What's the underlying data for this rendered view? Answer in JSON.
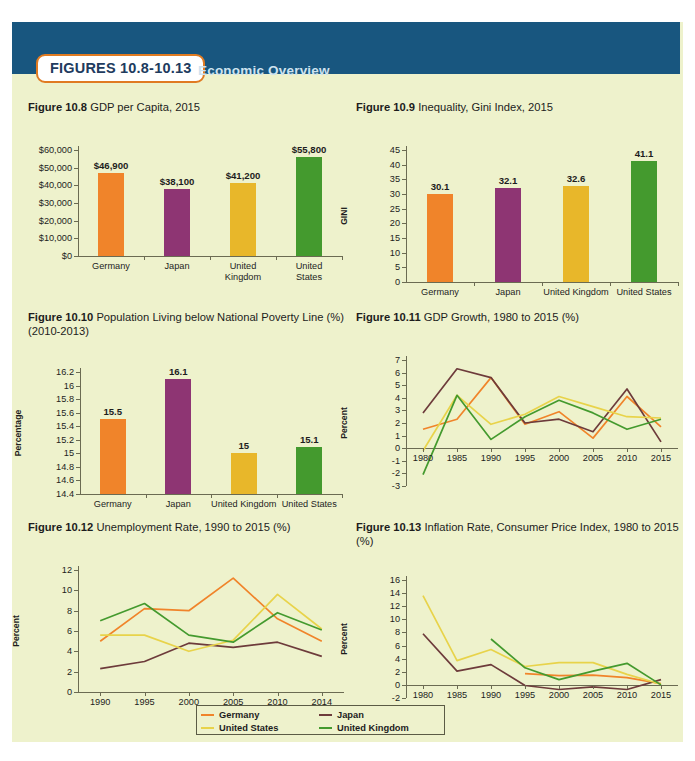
{
  "header": {
    "badge_label": "FIGURES 10.8-10.13",
    "title": "Economic Overview",
    "bar_color": "#18567f",
    "badge_border_color": "#e07b22"
  },
  "palette": {
    "germany": "#f0842a",
    "japan": "#8e3573",
    "united_states": "#e8b72a",
    "united_kingdom": "#449a2e",
    "japan_line": "#6d3b3b",
    "background": "#eef2cc",
    "axis": "#6b6b52"
  },
  "legend": {
    "items": [
      {
        "label": "Germany",
        "color": "#f0842a"
      },
      {
        "label": "Japan",
        "color": "#6d3b3b"
      },
      {
        "label": "United States",
        "color": "#e8d34a"
      },
      {
        "label": "United Kingdom",
        "color": "#449a2e"
      }
    ]
  },
  "chart_data": [
    {
      "id": "fig108",
      "type": "bar",
      "title_bold": "Figure 10.8",
      "title_rest": " GDP per Capita, 2015",
      "categories": [
        "Germany",
        "Japan",
        "United\nKingdom",
        "United\nStates"
      ],
      "values": [
        46900,
        38100,
        41200,
        55800
      ],
      "value_labels": [
        "$46,900",
        "$38,100",
        "$41,200",
        "$55,800"
      ],
      "colors": [
        "#f0842a",
        "#8e3573",
        "#e8b72a",
        "#449a2e"
      ],
      "ylabel": "",
      "xlabel": "",
      "ylim": [
        0,
        60000
      ],
      "yticks": [
        0,
        10000,
        20000,
        30000,
        40000,
        50000,
        60000
      ],
      "ytick_labels": [
        "$0",
        "$10,000",
        "$20,000",
        "$30,000",
        "$40,000",
        "$50,000",
        "$60,000"
      ],
      "grid": false
    },
    {
      "id": "fig109",
      "type": "bar",
      "title_bold": "Figure 10.9",
      "title_rest": " Inequality, Gini Index, 2015",
      "categories": [
        "Germany",
        "Japan",
        "United Kingdom",
        "United States"
      ],
      "values": [
        30.1,
        32.1,
        32.6,
        41.1
      ],
      "value_labels": [
        "30.1",
        "32.1",
        "32.6",
        "41.1"
      ],
      "colors": [
        "#f0842a",
        "#8e3573",
        "#e8b72a",
        "#449a2e"
      ],
      "ylabel": "GINI",
      "xlabel": "",
      "ylim": [
        0,
        45
      ],
      "yticks": [
        0,
        5,
        10,
        15,
        20,
        25,
        30,
        35,
        40,
        45
      ],
      "ytick_labels": [
        "0",
        "5",
        "10",
        "15",
        "20",
        "25",
        "30",
        "35",
        "40",
        "45"
      ],
      "grid": false
    },
    {
      "id": "fig110",
      "type": "bar",
      "title_bold": "Figure 10.10",
      "title_rest": " Population Living below National Poverty Line (%) (2010-2013)",
      "categories": [
        "Germany",
        "Japan",
        "United Kingdom",
        "United States"
      ],
      "values": [
        15.5,
        16.1,
        15.0,
        15.1
      ],
      "value_labels": [
        "15.5",
        "16.1",
        "15",
        "15.1"
      ],
      "colors": [
        "#f0842a",
        "#8e3573",
        "#e8b72a",
        "#449a2e"
      ],
      "ylabel": "Percentage",
      "xlabel": "",
      "ylim": [
        14.4,
        16.2
      ],
      "yticks": [
        14.4,
        14.6,
        14.8,
        15.0,
        15.2,
        15.4,
        15.6,
        15.8,
        16.0,
        16.2
      ],
      "ytick_labels": [
        "14.4",
        "14.6",
        "14.8",
        "15",
        "15.2",
        "15.4",
        "15.6",
        "15.8",
        "16",
        "16.2"
      ],
      "grid": false
    },
    {
      "id": "fig111",
      "type": "line",
      "title_bold": "Figure 10.11",
      "title_rest": " GDP Growth, 1980 to 2015 (%)",
      "x": [
        "1980",
        "1985",
        "1990",
        "1995",
        "2000",
        "2005",
        "2010",
        "2015"
      ],
      "ylabel": "Percent",
      "xlabel": "",
      "ylim": [
        -3,
        7
      ],
      "yticks": [
        -3,
        -2,
        -1,
        0,
        1,
        2,
        3,
        4,
        5,
        6,
        7
      ],
      "ytick_labels": [
        "-3",
        "-2",
        "-1",
        "0",
        "1",
        "2",
        "3",
        "4",
        "5",
        "6",
        "7"
      ],
      "grid": false,
      "series": [
        {
          "name": "Germany",
          "color": "#f0842a",
          "values": [
            1.5,
            2.3,
            5.6,
            1.9,
            2.9,
            0.8,
            4.1,
            1.7
          ]
        },
        {
          "name": "Japan",
          "color": "#6d3b3b",
          "values": [
            2.8,
            6.3,
            5.6,
            2.0,
            2.3,
            1.3,
            4.7,
            0.5
          ]
        },
        {
          "name": "United States",
          "color": "#e8d34a",
          "values": [
            -0.2,
            4.2,
            1.9,
            2.7,
            4.1,
            3.3,
            2.5,
            2.4
          ]
        },
        {
          "name": "United Kingdom",
          "color": "#449a2e",
          "values": [
            -2.1,
            4.2,
            0.7,
            2.5,
            3.8,
            2.8,
            1.5,
            2.3
          ]
        }
      ]
    },
    {
      "id": "fig112",
      "type": "line",
      "title_bold": "Figure 10.12",
      "title_rest": " Unemployment Rate, 1990 to 2015 (%)",
      "x": [
        "1990",
        "1995",
        "2000",
        "2005",
        "2010",
        "2014"
      ],
      "ylabel": "Percent",
      "xlabel": "",
      "ylim": [
        0,
        12
      ],
      "yticks": [
        0,
        2,
        4,
        6,
        8,
        10,
        12
      ],
      "ytick_labels": [
        "0",
        "2",
        "4",
        "6",
        "8",
        "10",
        "12"
      ],
      "grid": false,
      "series": [
        {
          "name": "Germany",
          "color": "#f0842a",
          "values": [
            5.0,
            8.2,
            8.0,
            11.2,
            7.2,
            5.0
          ]
        },
        {
          "name": "Japan",
          "color": "#6d3b3b",
          "values": [
            2.3,
            3.0,
            4.8,
            4.4,
            4.9,
            3.5
          ]
        },
        {
          "name": "United States",
          "color": "#e8d34a",
          "values": [
            5.6,
            5.6,
            4.0,
            5.1,
            9.6,
            6.2
          ]
        },
        {
          "name": "United Kingdom",
          "color": "#449a2e",
          "values": [
            7.0,
            8.7,
            5.6,
            4.9,
            7.8,
            6.1
          ]
        }
      ]
    },
    {
      "id": "fig113",
      "type": "line",
      "title_bold": "Figure 10.13",
      "title_rest": " Inflation Rate, Consumer Price Index, 1980 to 2015 (%)",
      "x": [
        "1980",
        "1985",
        "1990",
        "1995",
        "2000",
        "2005",
        "2010",
        "2015"
      ],
      "ylabel": "Percent",
      "xlabel": "",
      "ylim": [
        -2,
        16
      ],
      "yticks": [
        -2,
        0,
        2,
        4,
        6,
        8,
        10,
        12,
        14,
        16
      ],
      "ytick_labels": [
        "-2",
        "0",
        "2",
        "4",
        "6",
        "8",
        "10",
        "12",
        "14",
        "16"
      ],
      "grid": false,
      "series": [
        {
          "name": "Germany",
          "color": "#f0842a",
          "values": [
            null,
            null,
            null,
            1.7,
            1.4,
            1.5,
            1.1,
            0.2
          ]
        },
        {
          "name": "Japan",
          "color": "#6d3b3b",
          "values": [
            7.8,
            2.1,
            3.1,
            -0.1,
            -0.7,
            -0.3,
            -0.7,
            0.8
          ]
        },
        {
          "name": "United States",
          "color": "#e8d34a",
          "values": [
            13.6,
            3.7,
            5.4,
            2.8,
            3.4,
            3.4,
            1.6,
            0.1
          ]
        },
        {
          "name": "United Kingdom",
          "color": "#449a2e",
          "values": [
            null,
            null,
            7.0,
            2.6,
            0.8,
            2.1,
            3.3,
            0.0
          ]
        }
      ]
    }
  ]
}
